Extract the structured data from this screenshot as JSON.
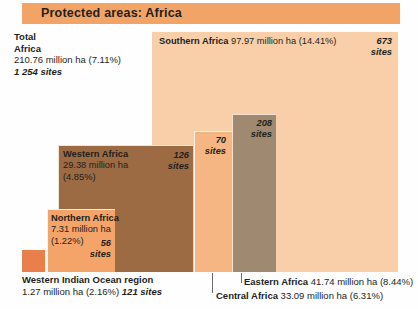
{
  "title": "Protected areas: Africa",
  "total": {
    "line1": "Total",
    "line2": "Africa",
    "area": "210.76 million ha (7.11%)",
    "sites": "1 254 sites"
  },
  "chart_data": {
    "type": "treemap",
    "title": "Protected areas: Africa",
    "unit": "million ha",
    "value_label": "area",
    "categories": [
      "Southern Africa",
      "Eastern Africa",
      "Central Africa",
      "Western Africa",
      "Northern Africa",
      "Western Indian Ocean region"
    ],
    "values": [
      97.97,
      41.74,
      33.09,
      29.38,
      7.31,
      1.27
    ],
    "percent": [
      14.41,
      8.44,
      6.31,
      4.85,
      1.22,
      2.16
    ],
    "sites": [
      673,
      208,
      70,
      126,
      56,
      121
    ],
    "total": {
      "value": 210.76,
      "percent": 7.11,
      "sites": 1254,
      "name": "Total Africa"
    },
    "colors": [
      "#f8cfa9",
      "#a08971",
      "#f5b683",
      "#9c6b44",
      "#f4a469",
      "#e97f4b"
    ],
    "legend": "none",
    "grid": false
  },
  "regions": {
    "southern": {
      "name": "Southern Africa",
      "value": "97.97 million ha (14.41%)",
      "sites_number": "673",
      "sites_word": "sites"
    },
    "eastern": {
      "name": "Eastern Africa",
      "value": "41.74 million ha (8.44%)",
      "sites_number": "208",
      "sites_word": "sites"
    },
    "central": {
      "name": "Central Africa",
      "value": "33.09 million ha (6.31%)",
      "sites_number": "70",
      "sites_word": "sites"
    },
    "western": {
      "name": "Western Africa",
      "value_line1": "29.38 million ha",
      "value_line2": "(4.85%)",
      "sites_number": "126",
      "sites_word": "sites"
    },
    "northern": {
      "name": "Northern Africa",
      "value_line1": "7.31 million ha",
      "value_line2": "(1.22%)",
      "sites_number": "56",
      "sites_word": "sites"
    },
    "wio": {
      "name": "Western Indian Ocean region",
      "value": "1.27 million ha (2.16%)",
      "sites": "121 sites"
    }
  },
  "colors": {
    "title_bar": "#f2a466",
    "southern": "#f8cfa9",
    "eastern": "#a08971",
    "central": "#f5b683",
    "western": "#9c6b44",
    "northern": "#f4a469",
    "wio": "#e97f4b",
    "text": "#231f1c"
  }
}
